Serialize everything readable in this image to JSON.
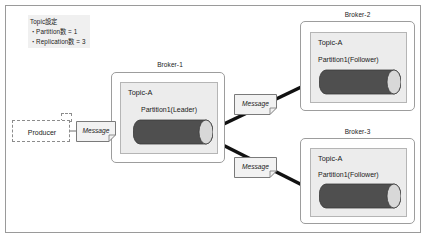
{
  "diagram": {
    "legend": {
      "line1": "Topic設定",
      "line2": "・Partition数 = 1",
      "line3": "・Replication数 = 3"
    },
    "producer": {
      "label": "Producer"
    },
    "messages": [
      {
        "label": "Message"
      },
      {
        "label": "Message"
      },
      {
        "label": "Message"
      }
    ],
    "brokers": [
      {
        "name": "Broker-1",
        "topic": "Topic-A",
        "partition": "Partition1(Leader)",
        "role": "Leader"
      },
      {
        "name": "Broker-2",
        "topic": "Topic-A",
        "partition": "Partition1(Follower)",
        "role": "Follower"
      },
      {
        "name": "Broker-3",
        "topic": "Topic-A",
        "partition": "Partition1(Follower)",
        "role": "Follower"
      }
    ],
    "colors": {
      "frame_border": "#9a9a9a",
      "broker_border": "#9d9d9d",
      "topic_fill": "#ececec",
      "topic_border": "#b5b5b5",
      "cylinder_body": "#4f4f4f",
      "cylinder_cap": "#d8d8d8",
      "note_fill": "#f2f2f2",
      "note_border": "#7a7a7a",
      "arrow": "#111111",
      "legend_fill": "#f0f0f0",
      "producer_border": "#8c8c8c"
    }
  }
}
